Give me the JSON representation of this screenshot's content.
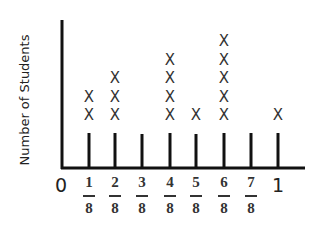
{
  "chart_data": {
    "type": "line plot (dot plot)",
    "title": "",
    "xlabel": "",
    "ylabel": "Number of Students",
    "categories": [
      "1/8",
      "2/8",
      "3/8",
      "4/8",
      "5/8",
      "6/8",
      "7/8",
      "1"
    ],
    "values": [
      2,
      3,
      0,
      4,
      1,
      5,
      0,
      1
    ],
    "x_tick_labels": [
      "0",
      "1/8",
      "2/8",
      "3/8",
      "4/8",
      "5/8",
      "6/8",
      "7/8",
      "1"
    ],
    "marker": "X",
    "xlim": [
      0,
      1
    ],
    "grid": false
  },
  "labels": {
    "ylabel": "Number of Students",
    "zero": "0",
    "one": "1",
    "marker": "X",
    "numerators": [
      "1",
      "2",
      "3",
      "4",
      "5",
      "6",
      "7"
    ],
    "denominator": "8"
  }
}
